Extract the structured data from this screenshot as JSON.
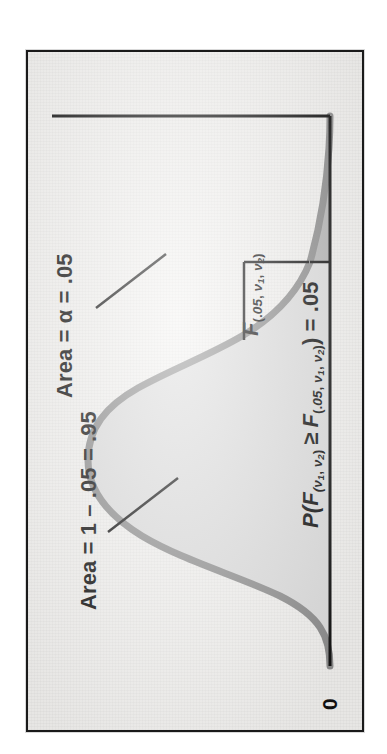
{
  "figure": {
    "kind": "f-distribution-density-plot",
    "orientation": "rotated-90-ccw",
    "background_color": "#f3f2f0",
    "frame_color": "#1a1a1a",
    "curve_color": "#8c8c8c",
    "body_fill_color": "#dcdcdc",
    "tail_fill_color": "#b4b4b4",
    "axis_color": "#111111",
    "labels": {
      "origin": "0",
      "area_body": "Area = 1 – .05 = .95",
      "area_tail": "Area = α = .05",
      "critical_value_F": "F",
      "critical_value_sub": "(.05, ν1, ν2)",
      "probability_P": "P(",
      "probability_F1": "F",
      "probability_F1_sub": "(ν1, ν2)",
      "probability_ge": "≥",
      "probability_F2": "F",
      "probability_F2_sub": "(.05, ν1, ν2)",
      "probability_tail": ") = .05"
    }
  },
  "chart_data": {
    "type": "area",
    "title": "",
    "subtitle": "",
    "xlabel": "",
    "ylabel": "",
    "xlim": [
      0,
      5
    ],
    "ylim": [
      0,
      1
    ],
    "grid": false,
    "legend": null,
    "distribution": "F",
    "parameters": {
      "nu1": "ν1",
      "nu2": "ν2"
    },
    "annotations": [
      {
        "name": "origin-tick",
        "text": "0",
        "x": 0,
        "y": 0
      },
      {
        "name": "body-area",
        "text": "Area = 1 – .05 = .95",
        "value": 0.95,
        "region": "x from 0 to F(.05)",
        "fill": "#dcdcdc"
      },
      {
        "name": "tail-area",
        "text": "Area = α = .05",
        "value": 0.05,
        "region": "x >= F(.05)",
        "fill": "#b4b4b4"
      },
      {
        "name": "critical-value",
        "text": "F(.05, ν1, ν2)",
        "x": 3.45
      },
      {
        "name": "probability-statement",
        "text": "P(F(ν1, ν2) ≥ F(.05, ν1, ν2)) = .05",
        "value": 0.05
      }
    ],
    "alpha": 0.05,
    "confidence": 0.95,
    "critical_x": 3.45,
    "x": [
      0.0,
      0.1,
      0.2,
      0.3,
      0.4,
      0.5,
      0.6,
      0.7,
      0.8,
      0.9,
      1.0,
      1.1,
      1.2,
      1.3,
      1.4,
      1.5,
      1.6,
      1.7,
      1.8,
      1.9,
      2.0,
      2.2,
      2.4,
      2.6,
      2.8,
      3.0,
      3.2,
      3.45,
      3.7,
      4.0,
      4.4,
      5.0
    ],
    "y": [
      0.0,
      0.3,
      0.56,
      0.76,
      0.895,
      0.972,
      1.0,
      0.992,
      0.96,
      0.912,
      0.856,
      0.796,
      0.735,
      0.676,
      0.618,
      0.564,
      0.513,
      0.466,
      0.423,
      0.383,
      0.347,
      0.283,
      0.231,
      0.189,
      0.155,
      0.127,
      0.105,
      0.082,
      0.065,
      0.049,
      0.033,
      0.018
    ]
  }
}
